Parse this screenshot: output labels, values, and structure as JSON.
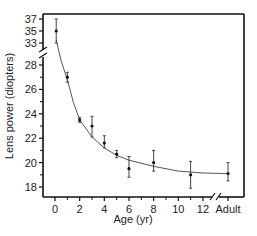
{
  "chart_data": {
    "type": "scatter",
    "title": "",
    "xlabel": "Age (yr)",
    "ylabel": "Lens power (diopters)",
    "x_ticks": [
      "0",
      "2",
      "4",
      "6",
      "8",
      "10",
      "12",
      "Adult"
    ],
    "x_minor_ticks": [
      1,
      3,
      5,
      7,
      9,
      11
    ],
    "y_ticks_lower": [
      18,
      20,
      22,
      24,
      26,
      28
    ],
    "y_ticks_upper": [
      33,
      35,
      37
    ],
    "y_axis_break": "between 28 and 33",
    "x_axis_break": "between 12 and Adult",
    "grid": false,
    "legend": null,
    "series": [
      {
        "name": "Measured lens power (mean ± error)",
        "points": [
          {
            "x": 0.1,
            "label": "0",
            "y": 35.0,
            "err_low": 33.0,
            "err_high": 37.0
          },
          {
            "x": 1,
            "label": "1",
            "y": 27.0,
            "err_low": 26.6,
            "err_high": 27.4
          },
          {
            "x": 2,
            "label": "2",
            "y": 23.5,
            "err_low": 23.3,
            "err_high": 23.7
          },
          {
            "x": 3,
            "label": "3",
            "y": 23.0,
            "err_low": 22.1,
            "err_high": 23.8
          },
          {
            "x": 4,
            "label": "4",
            "y": 21.6,
            "err_low": 21.2,
            "err_high": 22.2
          },
          {
            "x": 5,
            "label": "5",
            "y": 20.7,
            "err_low": 20.4,
            "err_high": 21.0
          },
          {
            "x": 6,
            "label": "6",
            "y": 19.5,
            "err_low": 18.8,
            "err_high": 20.5
          },
          {
            "x": 8,
            "label": "8",
            "y": 20.0,
            "err_low": 19.3,
            "err_high": 21.0
          },
          {
            "x": 11,
            "label": "11",
            "y": 19.0,
            "err_low": 17.9,
            "err_high": 20.1
          },
          {
            "x": "Adult",
            "label": "Adult",
            "y": 19.1,
            "err_low": 18.5,
            "err_high": 20.0
          }
        ]
      },
      {
        "name": "Exponential fit",
        "type": "line",
        "points": [
          {
            "x": 0.1,
            "y": 33.5
          },
          {
            "x": 0.5,
            "y": 30.0
          },
          {
            "x": 1,
            "y": 26.8
          },
          {
            "x": 1.5,
            "y": 24.9
          },
          {
            "x": 2,
            "y": 23.5
          },
          {
            "x": 3,
            "y": 22.1
          },
          {
            "x": 4,
            "y": 21.2
          },
          {
            "x": 5,
            "y": 20.6
          },
          {
            "x": 6,
            "y": 20.2
          },
          {
            "x": 8,
            "y": 19.7
          },
          {
            "x": 10,
            "y": 19.3
          },
          {
            "x": 12,
            "y": 19.15
          },
          {
            "x": "Adult",
            "y": 19.1
          }
        ]
      }
    ],
    "colors": {
      "axis": "#111111",
      "points": "#111111",
      "fit_line": "#555555",
      "error_bars": "#444444"
    }
  }
}
